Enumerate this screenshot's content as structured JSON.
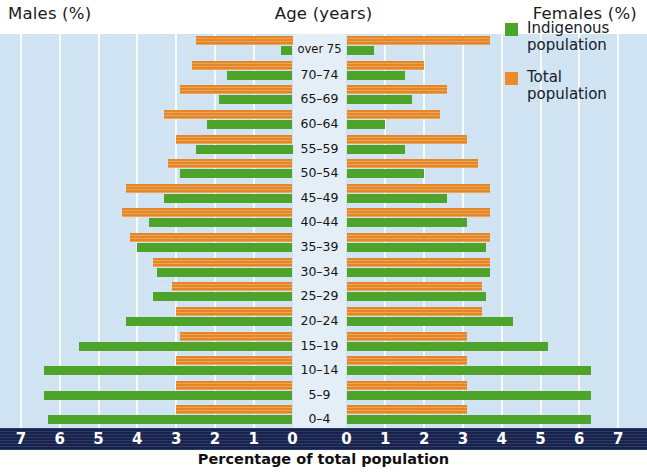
{
  "header": {
    "left_label": "Males (%)",
    "center_label": "Age (years)",
    "right_label": "Females  (%)"
  },
  "legend": {
    "position": "top-right",
    "items": [
      {
        "label_line1": "Indigenous",
        "label_line2": "population",
        "color": "#4ea32a",
        "key": "indigenous"
      },
      {
        "label_line1": "Total",
        "label_line2": "population",
        "color": "#ec8b28",
        "key": "total"
      }
    ]
  },
  "axis": {
    "title": "Percentage of total population",
    "ticks_left": [
      "7",
      "6",
      "5",
      "4",
      "3",
      "2",
      "1",
      "0"
    ],
    "ticks_right": [
      "0",
      "1",
      "2",
      "3",
      "4",
      "5",
      "6",
      "7"
    ],
    "band_color": "#1d2a5c"
  },
  "colors": {
    "indigenous": "#4ea32a",
    "total": "#ec8b28",
    "plot_background": "#cfe3f2",
    "center_band": "#e4eef7",
    "axis_band": "#1d2a5c",
    "gridline": "#ffffff"
  },
  "chart_data": {
    "type": "bar",
    "subtype": "population-pyramid",
    "title": "",
    "xlabel": "Percentage of total population",
    "ylabel": "Age (years)",
    "xlim": [
      0,
      7
    ],
    "grid": true,
    "legend_position": "top-right",
    "left_side": "Males (%)",
    "right_side": "Females  (%)",
    "categories": [
      "over 75",
      "70–74",
      "65–69",
      "60–64",
      "55–59",
      "50–54",
      "45–49",
      "40–44",
      "35–39",
      "30–34",
      "25–29",
      "20–24",
      "15–19",
      "10–14",
      "5–9",
      "0–4"
    ],
    "series": [
      {
        "name": "Indigenous population",
        "color": "#4ea32a",
        "males": [
          0.3,
          1.7,
          1.9,
          2.2,
          2.5,
          2.9,
          3.3,
          3.7,
          4.0,
          3.5,
          3.6,
          4.3,
          5.5,
          6.4,
          6.4,
          6.3
        ],
        "females": [
          0.7,
          1.5,
          1.7,
          1.0,
          1.5,
          2.0,
          2.6,
          3.1,
          3.6,
          3.7,
          3.6,
          4.3,
          5.2,
          6.3,
          6.3,
          6.3
        ]
      },
      {
        "name": "Total population",
        "color": "#ec8b28",
        "males": [
          2.5,
          2.6,
          2.9,
          3.3,
          3.0,
          3.2,
          4.3,
          4.4,
          4.2,
          3.6,
          3.1,
          3.0,
          2.9,
          3.0,
          3.0,
          3.0
        ],
        "females": [
          3.7,
          2.0,
          2.6,
          2.4,
          3.1,
          3.4,
          3.7,
          3.7,
          3.7,
          3.7,
          3.5,
          3.5,
          3.1,
          3.1,
          3.1,
          3.1
        ]
      }
    ]
  }
}
